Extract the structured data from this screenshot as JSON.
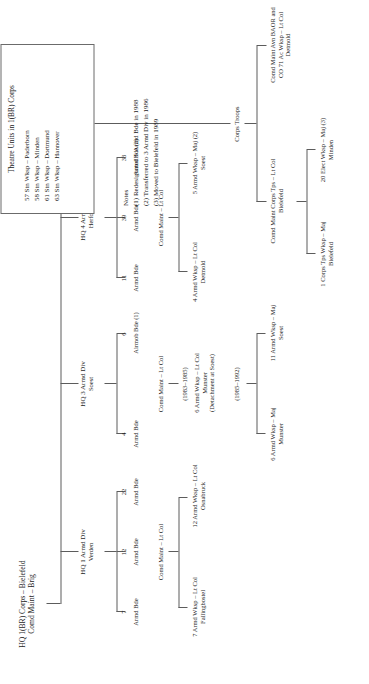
{
  "chart": {
    "type": "org-chart",
    "title": "HQ 1(BR) Corps – Bielefeld",
    "root": {
      "line1": "HQ 1(BR) Corps – Bielefeld",
      "line2": "Comd Maint – Brig"
    },
    "divisions": [
      {
        "id": "div1",
        "hq_line1": "HQ 1 Armd Div",
        "hq_line2": "Verden",
        "brigades": [
          {
            "num": "7",
            "label": "Armd Bde"
          },
          {
            "num": "12",
            "label": "Armd Bde"
          },
          {
            "num": "22",
            "label": "Armd Bde"
          }
        ],
        "comd_maint": "Comd Maint – Lt Col",
        "workshops": [
          {
            "line1": "7 Armd Wksp – Lt Col",
            "line2": "Fallingbostel"
          },
          {
            "line1": "12 Armd Wksp – Lt Col",
            "line2": "Osnabruck"
          }
        ]
      },
      {
        "id": "div3",
        "hq_line1": "HQ 3 Armd Div",
        "hq_line2": "Soest",
        "brigades": [
          {
            "num": "4",
            "label": "Armd Bde"
          },
          {
            "num": "6",
            "label": "Airmob Bde (1)"
          }
        ],
        "comd_maint": "Comd Maint – Lt Col",
        "period_early": "(1983–1985)",
        "workshop_early": {
          "line1": "6 Armd Wksp – Lt Col",
          "line2": "Munster",
          "line3": "(Detachment at Soest)"
        },
        "period_late": "(1985–1992)",
        "workshops_late": [
          {
            "line1": "6 Armd Wksp – Maj",
            "line2": "Munster"
          },
          {
            "line1": "11 Armd Wksp – Maj",
            "line2": "Soest"
          }
        ]
      },
      {
        "id": "div4",
        "hq_line1": "HQ 4 Armd Div",
        "hq_line2": "Herford",
        "brigades": [
          {
            "num": "11",
            "label": "Armd Bde"
          },
          {
            "num": "39",
            "label": "Armd Bde"
          },
          {
            "num": "33",
            "label": "Armd Bde (2)"
          }
        ],
        "comd_maint": "Comd Maint – Lt Col",
        "workshops": [
          {
            "line1": "4 Armd Wksp – Lt Col",
            "line2": "Detmold"
          },
          {
            "line1": "5 Armd Wksp – Maj (2)",
            "line2": "Soest"
          }
        ]
      }
    ],
    "corps_troops": {
      "label": "Corps Troops",
      "branches": [
        {
          "line1": "Comd Maint Corps Tps – Lt Col",
          "line2": "Bielefeld",
          "children": [
            {
              "line1": "1 Corps Tps Wksp – Maj",
              "line2": "Bielefeld"
            },
            {
              "line1": "20 Elect Wksp – Maj (3)",
              "line2": "Minden"
            }
          ]
        },
        {
          "line1": "Comd Maint Avn BAOR and",
          "line2": "CO 71 Ac Wksp – Lt Col",
          "line3": "Detmold",
          "children": []
        }
      ]
    },
    "theatre_units": {
      "title": "Theatre Units in 1(BR) Corps",
      "items": [
        "57 Stn Wksp – Paderborn",
        "58 Stn Wksp – Minden",
        "61 Stn Wksp – Dortmund",
        "63 Stn Wksp – Hannover"
      ]
    },
    "notes": {
      "heading": "Notes",
      "items": [
        "(1)  Redesignated 6 Armd Bde in 1988",
        "(2)  Transferred to 3 Armd Div in 1986",
        "(3)  Moved to Bielefeld in 1989"
      ]
    },
    "colors": {
      "line": "#5c5c5c",
      "text": "#1d1d1d",
      "box_border": "#6b6b6b",
      "background": "#ffffff"
    }
  }
}
